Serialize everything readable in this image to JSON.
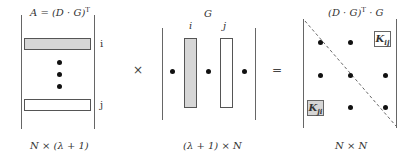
{
  "matrix_A": {
    "title": "A = (D · G)",
    "title_sup": "T",
    "row_i_label": "i",
    "row_j_label": "j",
    "dimension": "N × (λ + 1)"
  },
  "operator_multiply": "×",
  "matrix_G": {
    "title": "G",
    "col_i_label": "i",
    "col_j_label": "j",
    "dimension": "(λ + 1) × N"
  },
  "operator_equals": "=",
  "matrix_K": {
    "title_pre": "(D · G)",
    "title_sup": "T",
    "title_post": " · G",
    "kij_main": "K",
    "kij_sub": "ij",
    "kji_main": "K",
    "kji_sub": "ji",
    "dimension": "N × N"
  },
  "colors": {
    "shaded_fill": "#d6d6d6",
    "line": "#666666",
    "dot": "#111111"
  }
}
